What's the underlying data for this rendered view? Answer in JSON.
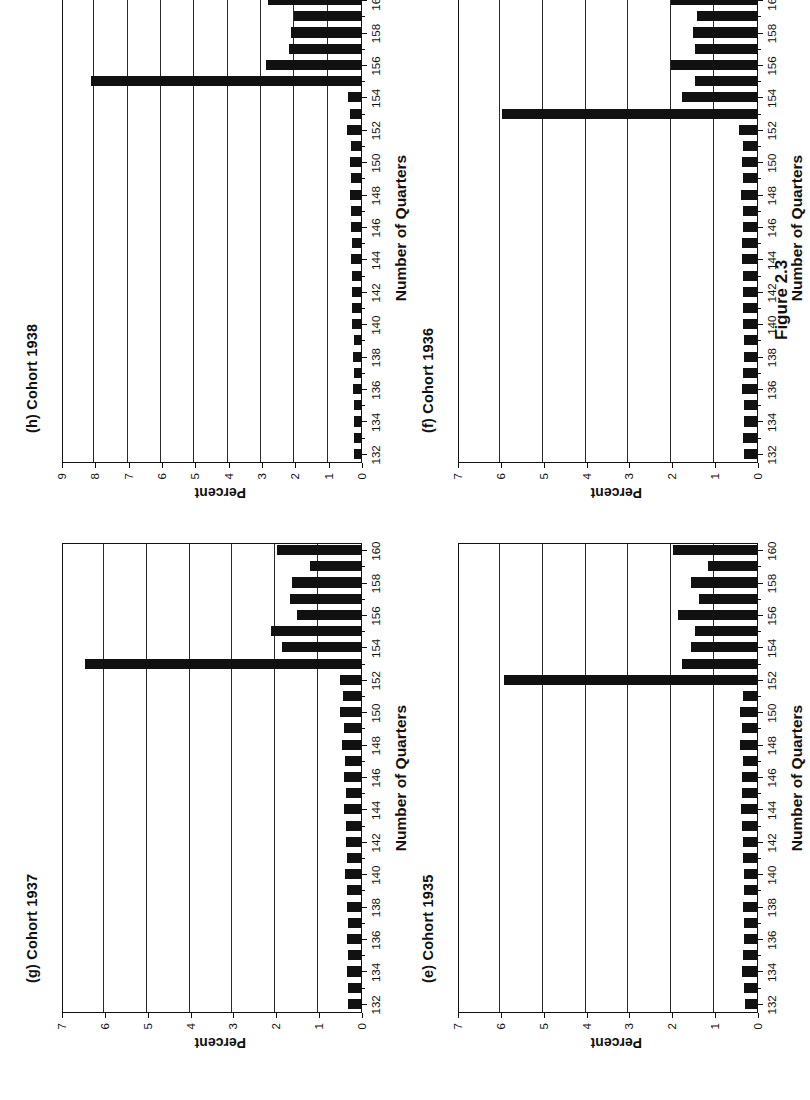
{
  "figure": {
    "caption": "Figure 2.3"
  },
  "common": {
    "xlabel": "Number of Quarters",
    "ylabel": "Percent",
    "xticks": [
      132,
      134,
      136,
      138,
      140,
      142,
      144,
      146,
      148,
      150,
      152,
      154,
      156,
      158,
      160
    ]
  },
  "chart_data": [
    {
      "id": "panel-e",
      "type": "bar",
      "title": "(e) Cohort 1935",
      "xlabel": "Number of Quarters",
      "ylabel": "Percent",
      "ylim": [
        0,
        7
      ],
      "yticks": [
        0,
        1,
        2,
        3,
        4,
        5,
        6,
        7
      ],
      "xlim": [
        131.5,
        160.5
      ],
      "xticks": [
        132,
        134,
        136,
        138,
        140,
        142,
        144,
        146,
        148,
        150,
        152,
        154,
        156,
        158,
        160
      ],
      "grid": true,
      "categories": [
        132,
        133,
        134,
        135,
        136,
        137,
        138,
        139,
        140,
        141,
        142,
        143,
        144,
        145,
        146,
        147,
        148,
        149,
        150,
        151,
        152,
        153,
        154,
        155,
        156,
        157,
        158,
        159,
        160
      ],
      "values": [
        0.28,
        0.3,
        0.34,
        0.33,
        0.3,
        0.3,
        0.32,
        0.3,
        0.3,
        0.32,
        0.33,
        0.34,
        0.38,
        0.36,
        0.35,
        0.33,
        0.4,
        0.36,
        0.4,
        0.33,
        5.9,
        1.75,
        1.55,
        1.45,
        1.85,
        1.35,
        1.55,
        1.15,
        1.95
      ]
    },
    {
      "id": "panel-f",
      "type": "bar",
      "title": "(f) Cohort 1936",
      "xlabel": "Number of Quarters",
      "ylabel": "Percent",
      "ylim": [
        0,
        7
      ],
      "yticks": [
        0,
        1,
        2,
        3,
        4,
        5,
        6,
        7
      ],
      "xlim": [
        131.5,
        160.5
      ],
      "xticks": [
        132,
        134,
        136,
        138,
        140,
        142,
        144,
        146,
        148,
        150,
        152,
        154,
        156,
        158,
        160
      ],
      "grid": true,
      "categories": [
        132,
        133,
        134,
        135,
        136,
        137,
        138,
        139,
        140,
        141,
        142,
        143,
        144,
        145,
        146,
        147,
        148,
        149,
        150,
        151,
        152,
        153,
        154,
        155,
        156,
        157,
        158,
        159,
        160
      ],
      "values": [
        0.3,
        0.32,
        0.3,
        0.3,
        0.34,
        0.32,
        0.3,
        0.3,
        0.32,
        0.33,
        0.33,
        0.33,
        0.36,
        0.34,
        0.33,
        0.33,
        0.38,
        0.33,
        0.35,
        0.33,
        0.42,
        5.95,
        1.75,
        1.45,
        2.0,
        1.45,
        1.5,
        1.4,
        2.0
      ]
    },
    {
      "id": "panel-g",
      "type": "bar",
      "title": "(g) Cohort 1937",
      "xlabel": "Number of Quarters",
      "ylabel": "Percent",
      "ylim": [
        0,
        7
      ],
      "yticks": [
        0,
        1,
        2,
        3,
        4,
        5,
        6,
        7
      ],
      "xlim": [
        131.5,
        160.5
      ],
      "xticks": [
        132,
        134,
        136,
        138,
        140,
        142,
        144,
        146,
        148,
        150,
        152,
        154,
        156,
        158,
        160
      ],
      "grid": true,
      "categories": [
        132,
        133,
        134,
        135,
        136,
        137,
        138,
        139,
        140,
        141,
        142,
        143,
        144,
        145,
        146,
        147,
        148,
        149,
        150,
        151,
        152,
        153,
        154,
        155,
        156,
        157,
        158,
        159,
        160
      ],
      "values": [
        0.3,
        0.3,
        0.32,
        0.3,
        0.33,
        0.3,
        0.33,
        0.32,
        0.38,
        0.33,
        0.35,
        0.34,
        0.4,
        0.36,
        0.4,
        0.38,
        0.45,
        0.4,
        0.48,
        0.42,
        0.5,
        6.45,
        1.85,
        2.1,
        1.5,
        1.65,
        1.6,
        1.2,
        1.95
      ]
    },
    {
      "id": "panel-h",
      "type": "bar",
      "title": "(h) Cohort 1938",
      "xlabel": "Number of Quarters",
      "ylabel": "Percent",
      "ylim": [
        0,
        9
      ],
      "yticks": [
        0,
        1,
        2,
        3,
        4,
        5,
        6,
        7,
        8,
        9
      ],
      "xlim": [
        131.5,
        160.5
      ],
      "xticks": [
        132,
        134,
        136,
        138,
        140,
        142,
        144,
        146,
        148,
        150,
        152,
        154,
        156,
        158,
        160
      ],
      "grid": true,
      "categories": [
        132,
        133,
        134,
        135,
        136,
        137,
        138,
        139,
        140,
        141,
        142,
        143,
        144,
        145,
        146,
        147,
        148,
        149,
        150,
        151,
        152,
        153,
        154,
        155,
        156,
        157,
        158,
        159,
        160
      ],
      "values": [
        0.2,
        0.22,
        0.22,
        0.2,
        0.24,
        0.22,
        0.24,
        0.22,
        0.28,
        0.26,
        0.26,
        0.26,
        0.3,
        0.28,
        0.3,
        0.3,
        0.32,
        0.3,
        0.34,
        0.3,
        0.42,
        0.34,
        0.38,
        8.1,
        2.85,
        2.15,
        2.1,
        2.0,
        2.8
      ]
    }
  ]
}
